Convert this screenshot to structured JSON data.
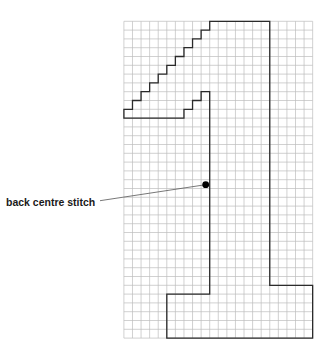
{
  "diagram": {
    "type": "knitting-chart",
    "grid": {
      "columns": 22,
      "rows": 36,
      "origin_x": 123.9,
      "origin_y": 21.3,
      "cell_width": 8.58,
      "cell_height": 8.8,
      "line_color": "#bdbdbd",
      "line_width": 0.7
    },
    "outline": {
      "color": "#2b2b2b",
      "stroke_width": 1.3,
      "points_grid": [
        [
          10,
          0
        ],
        [
          17,
          0
        ],
        [
          17,
          30
        ],
        [
          22,
          30
        ],
        [
          22,
          36
        ],
        [
          5,
          36
        ],
        [
          5,
          31
        ],
        [
          10,
          31
        ],
        [
          10,
          8
        ],
        [
          9,
          8
        ],
        [
          9,
          9
        ],
        [
          8,
          9
        ],
        [
          8,
          10
        ],
        [
          7,
          10
        ],
        [
          7,
          11
        ],
        [
          0,
          11
        ],
        [
          0,
          10
        ],
        [
          1,
          10
        ],
        [
          1,
          9
        ],
        [
          2,
          9
        ],
        [
          2,
          8
        ],
        [
          3,
          8
        ],
        [
          3,
          7
        ],
        [
          4,
          7
        ],
        [
          4,
          6
        ],
        [
          5,
          6
        ],
        [
          5,
          5
        ],
        [
          6,
          5
        ],
        [
          6,
          4
        ],
        [
          7,
          4
        ],
        [
          7,
          3
        ],
        [
          8,
          3
        ],
        [
          8,
          2
        ],
        [
          9,
          2
        ],
        [
          9,
          1
        ],
        [
          10,
          1
        ]
      ]
    },
    "marker": {
      "name": "back-centre-stitch-dot",
      "x": 205.7,
      "y": 184.7,
      "radius": 3.4,
      "color": "#000000"
    },
    "annotation": {
      "label": "back centre stitch",
      "label_x": 6,
      "label_y": 197,
      "leader_from": [
        100,
        200.7
      ],
      "leader_to": [
        205.7,
        184.7
      ],
      "leader_color": "#555555"
    }
  }
}
